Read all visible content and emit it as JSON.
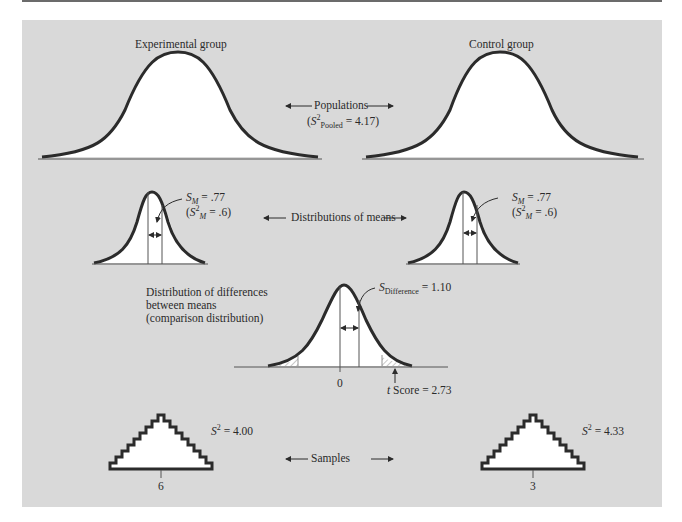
{
  "figure": {
    "populations": {
      "left_label": "Experimental group",
      "right_label": "Control group",
      "center_label": "Populations",
      "pooled_var_prefix": "(",
      "pooled_var_symbol": "S",
      "pooled_var_sup": "2",
      "pooled_var_sub": "Pooled",
      "pooled_var_value": " = 4.17)"
    },
    "means": {
      "center_label": "Distributions of means",
      "left": {
        "sm_symbol": "S",
        "sm_sub": "M",
        "sm_value": " = .77",
        "var_prefix": "(",
        "var_symbol": "S",
        "var_sup": "2",
        "var_sub": "M",
        "var_value": " = .6)"
      },
      "right": {
        "sm_symbol": "S",
        "sm_sub": "M",
        "sm_value": " = .77",
        "var_prefix": "(",
        "var_symbol": "S",
        "var_sup": "2",
        "var_sub": "M",
        "var_value": " = .6)"
      }
    },
    "comparison": {
      "title_line1": "Distribution of differences",
      "title_line2": "between means",
      "title_line3": "(comparison distribution)",
      "sd_symbol": "S",
      "sd_sub": "Difference",
      "sd_value": " = 1.10",
      "zero_label": "0",
      "t_symbol": "t",
      "t_label": " Score = 2.73"
    },
    "samples": {
      "center_label": "Samples",
      "left": {
        "var_symbol": "S",
        "var_sup": "2",
        "var_value": " = 4.00",
        "mean_label": "6"
      },
      "right": {
        "var_symbol": "S",
        "var_sup": "2",
        "var_value": " = 4.33",
        "mean_label": "3"
      }
    },
    "colors": {
      "panel": "#d9d9d9",
      "curve": "#2b2b2b",
      "fill": "#ffffff",
      "hatch": "#9a9a9a"
    }
  }
}
